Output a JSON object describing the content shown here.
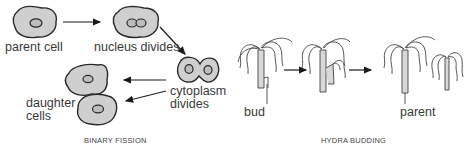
{
  "binary_fission": {
    "caption": "BINARY FISSION",
    "labels": {
      "parent_cell": "parent cell",
      "nucleus_divides": "nucleus divides",
      "cytoplasm_divides_line1": "cytoplasm",
      "cytoplasm_divides_line2": "divides",
      "daughter_cells_line1": "daughter",
      "daughter_cells_line2": "cells"
    }
  },
  "hydra_budding": {
    "caption": "HYDRA BUDDING",
    "labels": {
      "bud": "bud",
      "parent": "parent"
    }
  },
  "colors": {
    "cell_fill": "#cfcfcf",
    "outline": "#2a2a2a",
    "body_fill": "#d8d8d8",
    "arrow": "#1a1a1a"
  }
}
